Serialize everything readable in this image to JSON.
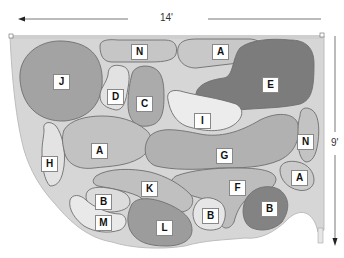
{
  "diagram": {
    "type": "garden-planting-plan",
    "dimensions": {
      "width_label": "14'",
      "height_label": "9'"
    },
    "colors": {
      "dark": "#7a7a7a",
      "medium": "#a9a9a9",
      "light": "#c4c4c4",
      "pale": "#e4e4e4",
      "border_bed": "#d0d0d0",
      "outline": "#6e6e6e"
    },
    "regions": [
      {
        "id": "J",
        "label": "J",
        "shade": "medium"
      },
      {
        "id": "N1",
        "label": "N",
        "shade": "light"
      },
      {
        "id": "A1",
        "label": "A",
        "shade": "light"
      },
      {
        "id": "E",
        "label": "E",
        "shade": "dark"
      },
      {
        "id": "D",
        "label": "D",
        "shade": "pale"
      },
      {
        "id": "C",
        "label": "C",
        "shade": "medium"
      },
      {
        "id": "I",
        "label": "I",
        "shade": "pale"
      },
      {
        "id": "H",
        "label": "H",
        "shade": "pale"
      },
      {
        "id": "A2",
        "label": "A",
        "shade": "light"
      },
      {
        "id": "G",
        "label": "G",
        "shade": "medium"
      },
      {
        "id": "N2",
        "label": "N",
        "shade": "light"
      },
      {
        "id": "A3",
        "label": "A",
        "shade": "light"
      },
      {
        "id": "K",
        "label": "K",
        "shade": "light"
      },
      {
        "id": "F",
        "label": "F",
        "shade": "light"
      },
      {
        "id": "B1",
        "label": "B",
        "shade": "pale"
      },
      {
        "id": "M",
        "label": "M",
        "shade": "pale"
      },
      {
        "id": "L",
        "label": "L",
        "shade": "medium"
      },
      {
        "id": "B2",
        "label": "B",
        "shade": "pale"
      },
      {
        "id": "B3",
        "label": "B",
        "shade": "dark"
      }
    ]
  }
}
